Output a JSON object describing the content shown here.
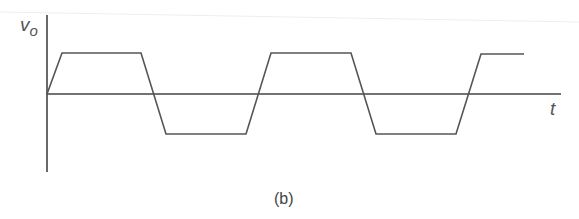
{
  "figure": {
    "caption": "(b)",
    "y_axis_label": "v",
    "y_axis_subscript": "o",
    "x_axis_label": "t",
    "stroke_color": "#444444"
  },
  "waveform": {
    "type": "trapezoidal square wave",
    "description": "Output voltage v_o versus time t: rises from zero with finite slew rate to a positive saturation level, stays flat, falls with finite slope through zero to a negative saturation level, repeats.",
    "axis": {
      "origin": [
        47,
        94
      ],
      "y_top": 15,
      "y_bottom": 172,
      "x_end": 561
    },
    "levels": {
      "high_y": 53,
      "zero_y": 94,
      "low_y": 134
    },
    "points": [
      [
        47,
        94
      ],
      [
        62,
        53
      ],
      [
        141,
        53
      ],
      [
        166,
        134
      ],
      [
        246,
        134
      ],
      [
        271,
        53
      ],
      [
        351,
        53
      ],
      [
        376,
        134
      ],
      [
        456,
        134
      ],
      [
        481,
        54
      ],
      [
        524,
        54
      ]
    ]
  }
}
